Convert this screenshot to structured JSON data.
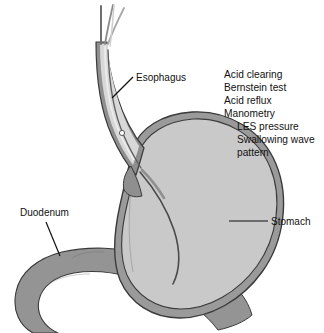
{
  "figure": {
    "background_color": "#ffffff"
  },
  "labels": {
    "esophagus": "Esophagus",
    "duodenum": "Duodenum",
    "stomach": "Stomach"
  },
  "test_list": {
    "items": [
      {
        "text": "Acid clearing",
        "indent": 0
      },
      {
        "text": "Bernstein test",
        "indent": 0
      },
      {
        "text": "Acid reflux",
        "indent": 0
      },
      {
        "text": "Manometry",
        "indent": 0
      },
      {
        "text": "LES pressure",
        "indent": 1
      },
      {
        "text": "Swallowing wave",
        "indent": 1
      },
      {
        "text": "pattern",
        "indent": 1
      }
    ]
  },
  "colors": {
    "outline": "#3a3a3a",
    "stomach_lumen": "#c9c9c9",
    "stomach_wall": "#9a9a9a",
    "duodenum_fill": "#949494",
    "esophagus_wall": "#8f8f8f",
    "esophagus_lumen": "#d8d8d8",
    "catheter": "#4a4a4a",
    "text": "#111111",
    "background": "#ffffff"
  },
  "parts": {
    "esophagus_name": "esophagus",
    "stomach_name": "stomach",
    "duodenum_name": "duodenum",
    "catheter_name": "manometry-catheter",
    "sensor_name": "pressure-sensor"
  }
}
